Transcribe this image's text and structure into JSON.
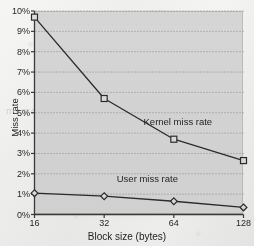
{
  "chart_data": {
    "type": "line",
    "title": "",
    "xlabel": "Block size (bytes)",
    "ylabel": "Miss rate",
    "categories": [
      "16",
      "32",
      "64",
      "128"
    ],
    "x_tick_labels": [
      "16",
      "32",
      "64",
      "128"
    ],
    "y_tick_labels": [
      "0%",
      "1%",
      "2%",
      "3%",
      "4%",
      "5%",
      "6%",
      "7%",
      "8%",
      "9%",
      "10%"
    ],
    "y_tick_values": [
      0,
      1,
      2,
      3,
      4,
      5,
      6,
      7,
      8,
      9,
      10
    ],
    "ylim": [
      0,
      10
    ],
    "y_unit": "%",
    "grid": "horizontal-dotted",
    "legend": "inline-annotations",
    "plot_background": "#d6d6d6",
    "line_color": "#2b2b2b",
    "series": [
      {
        "name": "Kernel miss rate",
        "marker": "square",
        "values": [
          9.7,
          5.7,
          3.7,
          2.65
        ],
        "annotation": "Kernel miss rate"
      },
      {
        "name": "User miss rate",
        "marker": "diamond",
        "values": [
          1.05,
          0.9,
          0.65,
          0.35
        ],
        "annotation": "User miss rate"
      }
    ]
  },
  "annotations": {
    "kernel": "Kernel miss rate",
    "user": "User miss rate"
  },
  "bleed_through": {
    "line_a": "memory",
    "line_b": "cache line",
    "line_c": "rate"
  }
}
